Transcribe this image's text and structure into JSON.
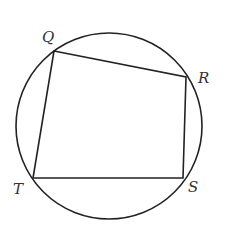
{
  "diagram": {
    "type": "inscribed-quadrilateral",
    "circle": {
      "cx": 109,
      "cy": 126,
      "r": 93
    },
    "stroke_color": "#222222",
    "label_color": "#333333",
    "vertices": [
      {
        "name": "Q",
        "x": 54,
        "y": 51,
        "label_x": 42,
        "label_y": 42
      },
      {
        "name": "R",
        "x": 186,
        "y": 77,
        "label_x": 198,
        "label_y": 83
      },
      {
        "name": "S",
        "x": 183,
        "y": 178,
        "label_x": 188,
        "label_y": 192
      },
      {
        "name": "T",
        "x": 33,
        "y": 178,
        "label_x": 13,
        "label_y": 194
      }
    ],
    "labels": {
      "q": "Q",
      "r": "R",
      "s": "S",
      "t": "T"
    }
  }
}
